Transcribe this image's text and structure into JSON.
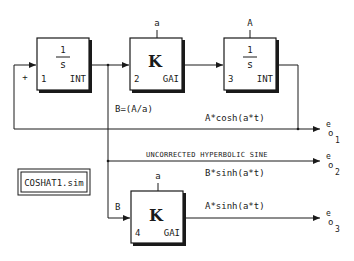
{
  "diagram": {
    "file_label": "COSHAT1.sim",
    "blocks": [
      {
        "id": 1,
        "number": "1",
        "type": "INT",
        "symbol_num": "1",
        "symbol_den": "s",
        "param": ""
      },
      {
        "id": 2,
        "number": "2",
        "type": "GAI",
        "symbol": "K",
        "param": "a"
      },
      {
        "id": 3,
        "number": "3",
        "type": "INT",
        "symbol_num": "1",
        "symbol_den": "s",
        "param": "A"
      },
      {
        "id": 4,
        "number": "4",
        "type": "GAI",
        "symbol": "K",
        "param": "a"
      }
    ],
    "labels": {
      "plus_sign": "+",
      "b_eq": "B=(A/a)",
      "b_input": "B",
      "cosh": "A*cosh(a*t)",
      "uncorrected": "UNCORRECTED HYPERBOLIC SINE",
      "bsinh": "B*sinh(a*t)",
      "asinh": "A*sinh(a*t)"
    },
    "outputs": [
      {
        "e": "e",
        "o": "o",
        "sub": "1"
      },
      {
        "e": "e",
        "o": "o",
        "sub": "2"
      },
      {
        "e": "e",
        "o": "o",
        "sub": "3"
      }
    ],
    "colors": {
      "line": "#1a1a1a",
      "background": "#ffffff"
    }
  }
}
